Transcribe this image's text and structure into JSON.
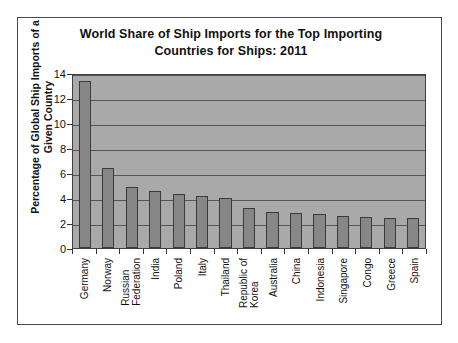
{
  "chart_data": {
    "type": "bar",
    "title": "World Share of Ship Imports for the Top Importing Countries for Ships: 2011",
    "title_lines": [
      "World Share of Ship Imports for the Top Importing",
      "Countries for Ships: 2011"
    ],
    "xlabel": "",
    "ylabel": "Percentage of Global Ship Imports of a Given Country",
    "ylabel_lines": [
      "Percentage of Global Ship Imports of a",
      "Given Country"
    ],
    "categories": [
      "Germany",
      "Norway",
      "Russian Federation",
      "India",
      "Poland",
      "Italy",
      "Thailand",
      "Republic of Korea",
      "Australia",
      "China",
      "Indonesia",
      "Singapore",
      "Congo",
      "Greece",
      "Spain"
    ],
    "category_label_lines": [
      [
        "Germany"
      ],
      [
        "Norway"
      ],
      [
        "Russian",
        "Federation"
      ],
      [
        "India"
      ],
      [
        "Poland"
      ],
      [
        "Italy"
      ],
      [
        "Thailand"
      ],
      [
        "Republic of",
        "Korea"
      ],
      [
        "Australia"
      ],
      [
        "China"
      ],
      [
        "Indonesia"
      ],
      [
        "Singapore"
      ],
      [
        "Congo"
      ],
      [
        "Greece"
      ],
      [
        "Spain"
      ]
    ],
    "values": [
      13.4,
      6.4,
      4.9,
      4.6,
      4.3,
      4.15,
      4.0,
      3.2,
      2.9,
      2.8,
      2.7,
      2.6,
      2.5,
      2.4,
      2.4
    ],
    "ylim": [
      0,
      14
    ],
    "yticks": [
      0,
      2,
      4,
      6,
      8,
      10,
      12,
      14
    ],
    "ytick_labels": [
      "0",
      "2",
      "4",
      "6",
      "8",
      "10",
      "12",
      "14"
    ],
    "grid": true,
    "legend": "none",
    "colors": {
      "bar_fill": "#878787",
      "bar_border": "#3a3a3a",
      "plot_background": "#a9a9a9",
      "gridline": "#555555",
      "axis": "#333333",
      "text": "#111111",
      "frame_border": "#4a4a4a",
      "page_background": "#ffffff"
    }
  }
}
